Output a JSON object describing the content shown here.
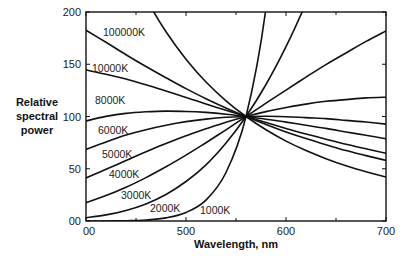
{
  "chart_data": {
    "type": "line",
    "title": "",
    "xlabel": "Wavelength, nm",
    "ylabel": "Relative spectral power",
    "xlim": [
      400,
      700
    ],
    "ylim": [
      0,
      200
    ],
    "grid": false,
    "legend": "inline labels on curves",
    "x_ticks": [
      400,
      500,
      600,
      700
    ],
    "x_tick_labels": [
      "00",
      "500",
      "600",
      "700"
    ],
    "y_ticks": [
      0,
      50,
      100,
      150,
      200
    ],
    "y_tick_labels": [
      "00",
      "50",
      "100",
      "150",
      "200"
    ],
    "normalization": "all curves equal 100 at 560 nm",
    "x": [
      400,
      420,
      440,
      460,
      480,
      500,
      520,
      540,
      560,
      580,
      600,
      620,
      640,
      660,
      680,
      700
    ],
    "series": [
      {
        "name": "100000K",
        "values": [
          363.9,
          302.1,
          252.9,
          213.2,
          181.1,
          154.8,
          133.0,
          115.0,
          100,
          87.3,
          76.5,
          67.4,
          59.6,
          52.8,
          47.1,
          42.1
        ]
      },
      {
        "name": "10000K",
        "values": [
          182.6,
          171.0,
          159.1,
          147.8,
          137.1,
          126.7,
          117.0,
          108.2,
          100,
          92.4,
          85.3,
          78.9,
          73.0,
          67.4,
          62.6,
          58.0
        ]
      },
      {
        "name": "8000K",
        "values": [
          144.5,
          140.5,
          135.8,
          130.3,
          124.4,
          118.3,
          112.0,
          105.9,
          100,
          94.2,
          88.6,
          83.3,
          78.3,
          73.4,
          69.1,
          64.8
        ]
      },
      {
        "name": "6000K",
        "values": [
          95.7,
          100.1,
          103.0,
          104.5,
          105.2,
          104.8,
          103.9,
          102.2,
          100,
          97.4,
          94.6,
          91.7,
          88.6,
          85.2,
          82.0,
          78.7
        ]
      },
      {
        "name": "5000K",
        "values": [
          68.5,
          75.6,
          82.2,
          87.4,
          91.7,
          95.1,
          97.5,
          99.2,
          100,
          100.2,
          99.8,
          98.9,
          98.0,
          96.3,
          94.7,
          92.7
        ]
      },
      {
        "name": "4000K",
        "values": [
          41.2,
          49.5,
          57.9,
          66.2,
          74.1,
          81.5,
          88.3,
          94.5,
          100,
          104.7,
          108.6,
          111.9,
          114.5,
          116.2,
          117.8,
          118.5
        ]
      },
      {
        "name": "3000K",
        "values": [
          17.5,
          24.3,
          32.3,
          41.5,
          51.9,
          63.1,
          74.9,
          87.3,
          100,
          112.7,
          125.3,
          137.7,
          149.7,
          160.8,
          171.9,
          181.9
        ]
      },
      {
        "name": "2000K",
        "values": [
          3.2,
          5.8,
          10.1,
          16.4,
          25.4,
          37.8,
          53.8,
          74.6,
          100,
          130.6,
          166.8,
          208.5,
          255.5,
          307.8,
          366.0,
          428.0
        ]
      },
      {
        "name": "1000K",
        "values": [
          0.0,
          0.0,
          0.3,
          1.0,
          3.0,
          8.1,
          20.0,
          46.4,
          100,
          204.0,
          393.0,
          720.0,
          1270.0,
          2150.0,
          3520.0,
          5580.0
        ]
      }
    ],
    "curve_labels": [
      {
        "text": "100000K",
        "x": 103,
        "y": 36
      },
      {
        "text": "10000K",
        "x": 92,
        "y": 72
      },
      {
        "text": "8000K",
        "x": 95,
        "y": 104
      },
      {
        "text": "6000K",
        "x": 98,
        "y": 134
      },
      {
        "text": "5000K",
        "x": 102,
        "y": 158
      },
      {
        "text": "4000K",
        "x": 109,
        "y": 178
      },
      {
        "text": "3000K",
        "x": 121,
        "y": 199
      },
      {
        "text": "2000K",
        "x": 150,
        "y": 212
      },
      {
        "text": "1000K",
        "x": 200,
        "y": 214
      }
    ]
  },
  "axes": {
    "x_title": "Wavelength, nm",
    "y_title_lines": [
      "Relative",
      "spectral",
      "power"
    ]
  }
}
